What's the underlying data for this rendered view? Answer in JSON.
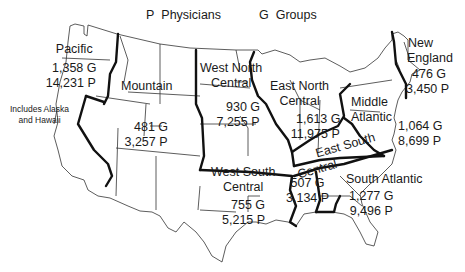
{
  "legend": {
    "physicians_key": "P",
    "physicians_label": "Physicians",
    "groups_key": "G",
    "groups_label": "Groups"
  },
  "regions": [
    {
      "name": "Pacific",
      "groups": "1,358 G",
      "physicians": "14,231 P",
      "note": [
        "Includes Alaska",
        "and Hawaii"
      ]
    },
    {
      "name": "Mountain",
      "groups": "481 G",
      "physicians": "3,257 P"
    },
    {
      "name_lines": [
        "West North",
        "Central"
      ],
      "groups": "930 G",
      "physicians": "7,255 P"
    },
    {
      "name_lines": [
        "East North",
        "Central"
      ],
      "groups": "1,613 G",
      "physicians": "11,975 P"
    },
    {
      "name_lines": [
        "New",
        "England"
      ],
      "groups": "476 G",
      "physicians": "3,450 P"
    },
    {
      "name_lines": [
        "Middle",
        "Atlantic"
      ],
      "groups": "1,064 G",
      "physicians": "8,699 P"
    },
    {
      "name_lines": [
        "West South",
        "Central"
      ],
      "groups": "755 G",
      "physicians": "5,215 P"
    },
    {
      "name_lines": [
        "East South",
        "Central"
      ],
      "groups": "507 G",
      "physicians": "3,134 P"
    },
    {
      "name_lines": [
        "South Atlantic"
      ],
      "groups": "1,277 G",
      "physicians": "9,496 P"
    }
  ]
}
